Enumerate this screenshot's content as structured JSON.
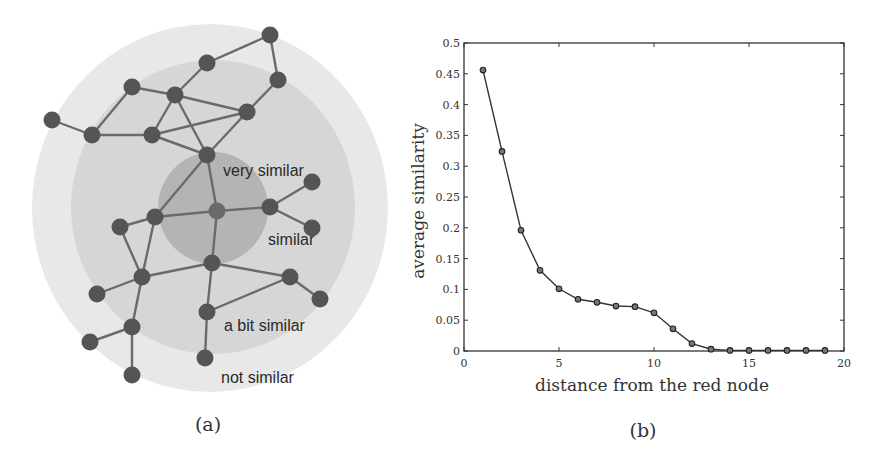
{
  "panel_a": {
    "caption": "(a)",
    "rings": [
      {
        "name": "outer-ring",
        "cx": 210,
        "cy": 208,
        "rx": 178,
        "ry": 184,
        "color": "#e8e8e8"
      },
      {
        "name": "middle-ring",
        "cx": 213,
        "cy": 207,
        "rx": 142,
        "ry": 147,
        "color": "#d6d6d6"
      },
      {
        "name": "inner-ring",
        "cx": 213,
        "cy": 208,
        "rx": 55,
        "ry": 56,
        "color": "#b4b4b4"
      }
    ],
    "labels": [
      {
        "text": "very similar",
        "x": 223,
        "y": 176
      },
      {
        "text": "similar",
        "x": 268,
        "y": 245
      },
      {
        "text": "a bit similar",
        "x": 224,
        "y": 331
      },
      {
        "text": "not similar",
        "x": 221,
        "y": 383
      }
    ],
    "node_color": "#555555",
    "edge_color": "#6b6b6b",
    "red_node_index": 13,
    "nodes": [
      [
        270,
        35
      ],
      [
        207,
        63
      ],
      [
        278,
        80
      ],
      [
        132,
        87
      ],
      [
        175,
        95
      ],
      [
        247,
        112
      ],
      [
        52,
        120
      ],
      [
        92,
        135
      ],
      [
        152,
        135
      ],
      [
        207,
        155
      ],
      [
        312,
        182
      ],
      [
        270,
        207
      ],
      [
        155,
        217
      ],
      [
        217,
        211
      ],
      [
        120,
        227
      ],
      [
        312,
        228
      ],
      [
        212,
        263
      ],
      [
        142,
        277
      ],
      [
        290,
        277
      ],
      [
        97,
        294
      ],
      [
        320,
        299
      ],
      [
        207,
        312
      ],
      [
        132,
        327
      ],
      [
        90,
        342
      ],
      [
        205,
        358
      ],
      [
        132,
        375
      ]
    ],
    "edges": [
      [
        0,
        1
      ],
      [
        0,
        2
      ],
      [
        1,
        4
      ],
      [
        2,
        5
      ],
      [
        3,
        4
      ],
      [
        3,
        7
      ],
      [
        6,
        7
      ],
      [
        7,
        8
      ],
      [
        4,
        8
      ],
      [
        4,
        5
      ],
      [
        4,
        9
      ],
      [
        8,
        5
      ],
      [
        8,
        9
      ],
      [
        5,
        9
      ],
      [
        9,
        12
      ],
      [
        9,
        13
      ],
      [
        12,
        14
      ],
      [
        12,
        13
      ],
      [
        13,
        11
      ],
      [
        11,
        10
      ],
      [
        11,
        15
      ],
      [
        13,
        16
      ],
      [
        12,
        17
      ],
      [
        14,
        17
      ],
      [
        16,
        17
      ],
      [
        16,
        18
      ],
      [
        16,
        21
      ],
      [
        18,
        20
      ],
      [
        18,
        21
      ],
      [
        17,
        19
      ],
      [
        17,
        22
      ],
      [
        22,
        23
      ],
      [
        22,
        25
      ],
      [
        21,
        24
      ]
    ]
  },
  "panel_b": {
    "caption": "(b)"
  },
  "chart_data": {
    "type": "line",
    "title": "",
    "xlabel": "distance from the red node",
    "ylabel": "average similarity",
    "xlim": [
      0,
      20
    ],
    "ylim": [
      0,
      0.5
    ],
    "xticks": [
      0,
      5,
      10,
      15,
      20
    ],
    "xtick_labels": [
      "0",
      "5",
      "10",
      "15",
      "20"
    ],
    "yticks": [
      0,
      0.05,
      0.1,
      0.15,
      0.2,
      0.25,
      0.3,
      0.35,
      0.4,
      0.45,
      0.5
    ],
    "ytick_labels": [
      "0",
      "0.05",
      "0.1",
      "0.15",
      "0.2",
      "0.25",
      "0.3",
      "0.35",
      "0.4",
      "0.45",
      "0.5"
    ],
    "grid": false,
    "legend": null,
    "marker": "circle",
    "line_color": "#333333",
    "series": [
      {
        "name": "average similarity",
        "x": [
          1,
          2,
          3,
          4,
          5,
          6,
          7,
          8,
          9,
          10,
          11,
          12,
          13,
          14,
          15,
          16,
          17,
          18,
          19
        ],
        "values": [
          0.456,
          0.324,
          0.196,
          0.131,
          0.101,
          0.084,
          0.079,
          0.073,
          0.072,
          0.062,
          0.036,
          0.012,
          0.003,
          0.001,
          0.001,
          0.001,
          0.001,
          0.001,
          0.001
        ]
      }
    ]
  }
}
